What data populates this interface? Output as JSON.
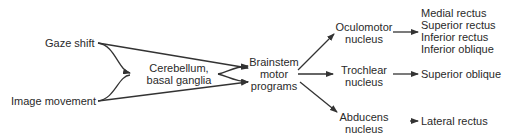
{
  "inputs": {
    "gaze_shift": "Gaze shift",
    "image_movement": "Image movement"
  },
  "integrator": {
    "line1": "Cerebellum,",
    "line2": "basal ganglia"
  },
  "brainstem": {
    "line1": "Brainstem",
    "line2": "motor",
    "line3": "programs"
  },
  "nuclei": [
    {
      "line1": "Oculomotor",
      "line2": "nucleus"
    },
    {
      "line1": "Trochlear",
      "line2": "nucleus"
    },
    {
      "line1": "Abducens",
      "line2": "nucleus"
    }
  ],
  "muscles": {
    "oculomotor": [
      "Medial rectus",
      "Superior rectus",
      "Inferior rectus",
      "Inferior oblique"
    ],
    "trochlear": [
      "Superior oblique"
    ],
    "abducens": [
      "Lateral rectus"
    ]
  },
  "colors": {
    "line": "#333333",
    "text": "#2a2a2a"
  }
}
